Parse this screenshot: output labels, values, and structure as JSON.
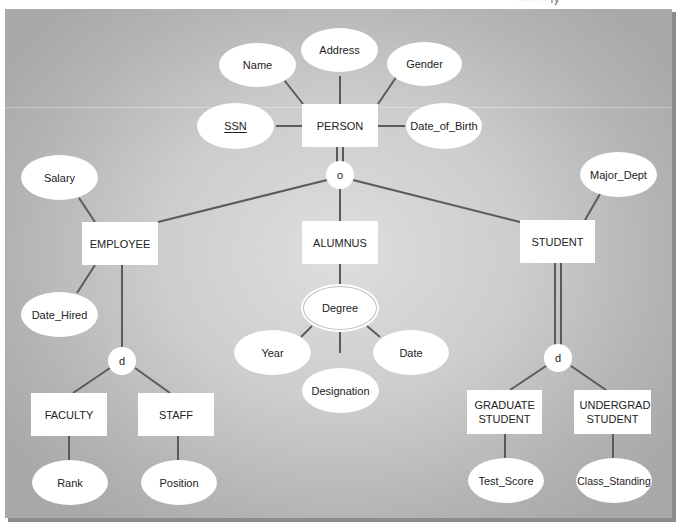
{
  "diagram": {
    "top_caption": "·········ry",
    "colors": {
      "line": "#5a5a5a",
      "node_fill": "#ffffff",
      "text": "#222222",
      "panel_edge": "#a9a9a9",
      "panel_center": "#dedede"
    },
    "entities": {
      "person": "PERSON",
      "employee": "EMPLOYEE",
      "alumnus": "ALUMNUS",
      "student": "STUDENT",
      "faculty": "FACULTY",
      "staff": "STAFF",
      "graduate_student": "GRADUATE STUDENT",
      "undergrad_student": "UNDERGRAD STUDENT"
    },
    "attributes": {
      "person": {
        "name": "Name",
        "address": "Address",
        "gender": "Gender",
        "ssn": "SSN",
        "date_of_birth": "Date_of_Birth"
      },
      "employee": {
        "salary": "Salary",
        "date_hired": "Date_Hired"
      },
      "student": {
        "major_dept": "Major_Dept"
      },
      "alumnus": {
        "degree": "Degree",
        "year": "Year",
        "date": "Date",
        "designation": "Designation"
      },
      "faculty": {
        "rank": "Rank"
      },
      "staff": {
        "position": "Position"
      },
      "graduate_student": {
        "test_score": "Test_Score"
      },
      "undergrad_student": {
        "class_standing": "Class_Standing"
      }
    },
    "specializations": {
      "person": {
        "symbol": "o",
        "meaning": "overlapping",
        "participation": "total"
      },
      "employee": {
        "symbol": "d",
        "meaning": "disjoint",
        "participation": "partial"
      },
      "student": {
        "symbol": "d",
        "meaning": "disjoint",
        "participation": "total"
      }
    },
    "key_attribute": "SSN",
    "multivalued_attribute": "Degree"
  }
}
